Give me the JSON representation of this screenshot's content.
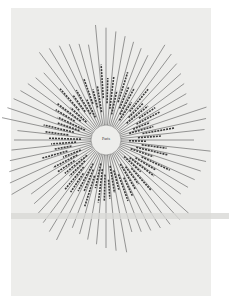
{
  "diagram": {
    "type": "radial",
    "center_label": "Paris",
    "center": {
      "x": 106,
      "y": 140
    },
    "hub_radius": 15,
    "ray_count": 64,
    "ray_color": "#555555",
    "page_color": "#ededeb",
    "hub_color": "#ededeb"
  }
}
